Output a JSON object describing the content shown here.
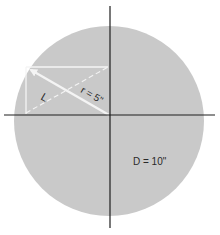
{
  "diagram": {
    "colors": {
      "background": "#ffffff",
      "circle_fill": "#c9c9c9",
      "axes": "#1e1e1e",
      "construction_lines": "#f4f4f4",
      "text": "#2a2a2a"
    },
    "labels": {
      "radius": "r = 5\"",
      "length": "L",
      "diameter": "D = 10\""
    },
    "elements": [
      {
        "name": "circle",
        "type": "circle",
        "diameter": "10\""
      },
      {
        "name": "horizontal-axis",
        "type": "line"
      },
      {
        "name": "vertical-axis",
        "type": "line"
      },
      {
        "name": "radius-arrow",
        "type": "arrow",
        "label": "r = 5\""
      },
      {
        "name": "chord-line",
        "type": "dashed-line",
        "label": "L"
      },
      {
        "name": "top-edge",
        "type": "line"
      },
      {
        "name": "left-edge",
        "type": "line"
      }
    ]
  }
}
